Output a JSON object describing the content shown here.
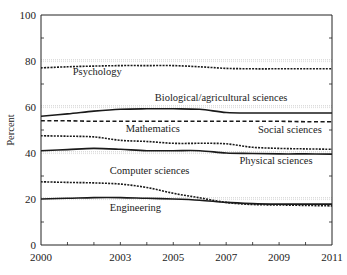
{
  "chart_data": {
    "type": "line",
    "title": "",
    "xlabel": "",
    "ylabel": "Percent",
    "xlim": [
      2000,
      2011
    ],
    "ylim": [
      0,
      100
    ],
    "x_ticks": [
      2000,
      2003,
      2005,
      2007,
      2009,
      2011
    ],
    "x_minor_ticks": [
      2001,
      2002,
      2003,
      2004,
      2005,
      2006,
      2007,
      2008,
      2009,
      2010
    ],
    "y_ticks": [
      0,
      20,
      40,
      60,
      80,
      100
    ],
    "y_minor_ticks": [
      10,
      30,
      50,
      70,
      90
    ],
    "grid": {
      "horizontal": [
        20,
        40,
        60,
        80
      ],
      "style": "dotted"
    },
    "legend": "inline labels",
    "x": [
      2000,
      2001,
      2002,
      2003,
      2004,
      2005,
      2006,
      2007,
      2008,
      2009,
      2010,
      2011
    ],
    "series": [
      {
        "name": "Psychology",
        "style": "dotted",
        "values": [
          77,
          77.5,
          77.8,
          78,
          78,
          78,
          77.5,
          76.8,
          76.6,
          76.6,
          76.6,
          76.6
        ],
        "label_pos": [
          2001.2,
          74
        ]
      },
      {
        "name": "Biological/agricultural sciences",
        "style": "solid",
        "values": [
          56,
          57,
          58.2,
          59,
          59.2,
          59.2,
          59,
          57.6,
          57.4,
          57.4,
          57.4,
          57.4
        ],
        "label_pos": [
          2004.3,
          62.5
        ]
      },
      {
        "name": "Social sciences",
        "style": "dashed",
        "values": [
          54,
          54,
          53.8,
          53.8,
          53.8,
          53.8,
          53.8,
          53.8,
          53.8,
          53.8,
          53.6,
          53.6
        ],
        "label_pos": [
          2008.2,
          48.8
        ]
      },
      {
        "name": "Mathematics",
        "style": "dotted",
        "values": [
          47.5,
          47.3,
          47,
          45.5,
          45,
          44.2,
          44.2,
          44,
          42.5,
          42,
          41.8,
          41.6
        ],
        "label_pos": [
          2003.2,
          49.2
        ]
      },
      {
        "name": "Physical sciences",
        "style": "solid",
        "values": [
          41,
          41.5,
          42,
          41.6,
          41,
          41,
          41,
          40,
          39.8,
          39.6,
          39.6,
          39.5
        ],
        "label_pos": [
          2007.5,
          35.4
        ]
      },
      {
        "name": "Computer sciences",
        "style": "dotted",
        "values": [
          27.5,
          27.2,
          27,
          26.5,
          25,
          22.5,
          20.5,
          18.5,
          17.6,
          17.4,
          17.2,
          17
        ],
        "label_pos": [
          2002.6,
          31
        ]
      },
      {
        "name": "Engineering",
        "style": "solid",
        "values": [
          20,
          20.3,
          20.6,
          20.6,
          20.3,
          20,
          19.5,
          18.5,
          18,
          17.8,
          17.8,
          17.8
        ],
        "label_pos": [
          2002.6,
          14.8
        ]
      }
    ]
  },
  "axes": {
    "ylabel": "Percent",
    "x_tick_labels": [
      "2000",
      "2003",
      "2005",
      "2007",
      "2009",
      "2011"
    ],
    "y_tick_labels": [
      "0",
      "20",
      "40",
      "60",
      "80",
      "100"
    ]
  }
}
